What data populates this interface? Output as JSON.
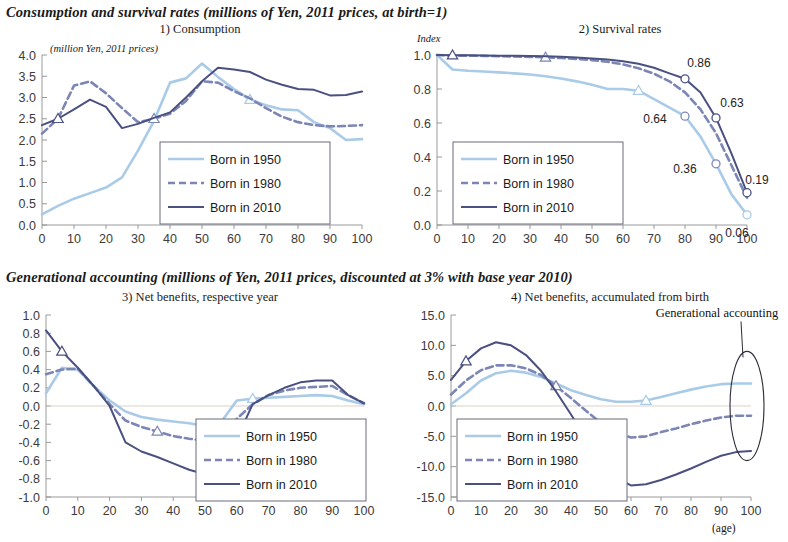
{
  "headings": {
    "section1": "Consumption and survival rates (millions of Yen, 2011 prices, at birth=1)",
    "section2": "Generational accounting (millions of Yen, 2011 prices, discounted at 3% with base year 2010)"
  },
  "axis_note_age": "(age)",
  "colors": {
    "born1950": "#a9cbe8",
    "born1980": "#7b86b5",
    "born2010": "#4a5080",
    "axis": "#8f8f8f",
    "gridline": "#cfcfcf",
    "text": "#1a1a1a"
  },
  "legend_labels": {
    "born1950": "Born in 1950",
    "born1980": "Born in 1980",
    "born2010": "Born in 2010"
  },
  "chart_data": [
    {
      "id": "consumption",
      "type": "line",
      "title": "1) Consumption",
      "unit_note": "(million Yen, 2011 prices)",
      "xlabel": "",
      "ylabel": "",
      "xlim": [
        0,
        100
      ],
      "ylim": [
        0,
        4.0
      ],
      "xticks": [
        0,
        10,
        20,
        30,
        40,
        50,
        60,
        70,
        80,
        90,
        100
      ],
      "yticks": [
        "0.0",
        "0.5",
        "1.0",
        "1.5",
        "2.0",
        "2.5",
        "3.0",
        "3.5",
        "4.0"
      ],
      "grid": false,
      "legend_position": "center-lower",
      "x": [
        0,
        5,
        10,
        15,
        20,
        25,
        30,
        35,
        40,
        45,
        50,
        55,
        60,
        65,
        70,
        75,
        80,
        85,
        90,
        95,
        100
      ],
      "series": [
        {
          "name": "Born in 1950",
          "color": "#a9cbe8",
          "style": "solid-light",
          "values": [
            0.25,
            0.45,
            0.62,
            0.75,
            0.88,
            1.12,
            1.75,
            2.45,
            3.35,
            3.45,
            3.8,
            3.48,
            3.2,
            2.95,
            2.82,
            2.72,
            2.7,
            2.42,
            2.28,
            2.0,
            2.02
          ],
          "marker": {
            "shape": "triangle",
            "x": 65
          }
        },
        {
          "name": "Born in 1980",
          "color": "#7b86b5",
          "style": "dashed",
          "values": [
            2.15,
            2.5,
            3.28,
            3.38,
            3.1,
            2.75,
            2.42,
            2.5,
            2.62,
            2.92,
            3.38,
            3.35,
            3.15,
            2.98,
            2.75,
            2.55,
            2.42,
            2.35,
            2.32,
            2.33,
            2.35
          ],
          "marker": {
            "shape": "triangle",
            "x": 35
          }
        },
        {
          "name": "Born in 2010",
          "color": "#4a5080",
          "style": "solid-dark",
          "values": [
            2.35,
            2.5,
            2.72,
            2.95,
            2.78,
            2.28,
            2.38,
            2.52,
            2.65,
            3.0,
            3.38,
            3.7,
            3.66,
            3.6,
            3.42,
            3.3,
            3.2,
            3.18,
            3.05,
            3.06,
            3.14
          ],
          "marker": {
            "shape": "triangle",
            "x": 5
          }
        }
      ]
    },
    {
      "id": "survival",
      "type": "line",
      "title": "2) Survival rates",
      "unit_note": "Index",
      "xlim": [
        0,
        100
      ],
      "ylim": [
        0,
        1.0
      ],
      "xticks": [
        0,
        10,
        20,
        30,
        40,
        50,
        60,
        70,
        80,
        90,
        100
      ],
      "yticks": [
        "0.0",
        "0.2",
        "0.4",
        "0.6",
        "0.8",
        "1.0"
      ],
      "grid": false,
      "legend_position": "center-left-lower",
      "x": [
        0,
        5,
        10,
        15,
        20,
        25,
        30,
        35,
        40,
        45,
        50,
        55,
        60,
        65,
        70,
        75,
        80,
        85,
        90,
        95,
        100
      ],
      "series": [
        {
          "name": "Born in 1950",
          "color": "#a9cbe8",
          "style": "solid-light",
          "values": [
            1.0,
            0.915,
            0.907,
            0.903,
            0.898,
            0.892,
            0.885,
            0.875,
            0.862,
            0.845,
            0.825,
            0.8,
            0.8,
            0.79,
            0.74,
            0.69,
            0.64,
            0.52,
            0.36,
            0.18,
            0.06
          ],
          "marker": {
            "shape": "triangle",
            "x": 65
          }
        },
        {
          "name": "Born in 1980",
          "color": "#7b86b5",
          "style": "dashed",
          "values": [
            1.0,
            0.997,
            0.996,
            0.995,
            0.993,
            0.991,
            0.989,
            0.986,
            0.982,
            0.977,
            0.97,
            0.96,
            0.945,
            0.922,
            0.89,
            0.845,
            0.78,
            0.68,
            0.54,
            0.35,
            0.16
          ],
          "marker": {
            "shape": "triangle",
            "x": 35
          }
        },
        {
          "name": "Born in 2010",
          "color": "#4a5080",
          "style": "solid-dark",
          "values": [
            1.0,
            0.999,
            0.998,
            0.997,
            0.996,
            0.995,
            0.994,
            0.992,
            0.989,
            0.985,
            0.98,
            0.973,
            0.963,
            0.948,
            0.925,
            0.892,
            0.86,
            0.78,
            0.63,
            0.42,
            0.19
          ],
          "marker": {
            "shape": "triangle",
            "x": 5
          }
        }
      ],
      "annotations": [
        {
          "label": "0.86",
          "x": 80,
          "y": 0.86,
          "series": "Born in 2010",
          "dot": true,
          "tx": 14,
          "ty": -12
        },
        {
          "label": "0.63",
          "x": 90,
          "y": 0.63,
          "series": "Born in 2010",
          "dot": true,
          "tx": 16,
          "ty": -11
        },
        {
          "label": "0.19",
          "x": 100,
          "y": 0.19,
          "series": "Born in 2010",
          "dot": true,
          "tx": 10,
          "ty": -9
        },
        {
          "label": "0.64",
          "x": 80,
          "y": 0.64,
          "series": "Born in 1980",
          "dot": true,
          "tx": -30,
          "ty": 7
        },
        {
          "label": "0.36",
          "x": 90,
          "y": 0.36,
          "series": "Born in 1980",
          "dot": true,
          "tx": -31,
          "ty": 9
        },
        {
          "label": "0.06",
          "x": 100,
          "y": 0.06,
          "series": "Born in 1950",
          "dot": true,
          "tx": -10,
          "ty": 22
        }
      ]
    },
    {
      "id": "net-benefits-year",
      "type": "line",
      "title": "3) Net benefits, respective year",
      "unit_note": "",
      "xlim": [
        0,
        100
      ],
      "ylim": [
        -1.0,
        1.0
      ],
      "xticks": [
        0,
        10,
        20,
        30,
        40,
        50,
        60,
        70,
        80,
        90,
        100
      ],
      "yticks": [
        "-1.0",
        "-0.8",
        "-0.6",
        "-0.4",
        "-0.2",
        "0.0",
        "0.2",
        "0.4",
        "0.6",
        "0.8",
        "1.0"
      ],
      "grid": false,
      "legend_position": "right-lower",
      "x": [
        0,
        5,
        10,
        15,
        20,
        25,
        30,
        35,
        40,
        45,
        50,
        55,
        60,
        65,
        70,
        75,
        80,
        85,
        90,
        95,
        100
      ],
      "series": [
        {
          "name": "Born in 1950",
          "color": "#a9cbe8",
          "style": "solid-light",
          "values": [
            0.14,
            0.42,
            0.4,
            0.22,
            0.06,
            -0.06,
            -0.12,
            -0.15,
            -0.17,
            -0.19,
            -0.22,
            -0.18,
            0.06,
            0.08,
            0.09,
            0.1,
            0.11,
            0.12,
            0.11,
            0.06,
            0.02
          ],
          "marker": {
            "shape": "triangle",
            "x": 65
          }
        },
        {
          "name": "Born in 1980",
          "color": "#7b86b5",
          "style": "dashed",
          "values": [
            0.35,
            0.4,
            0.41,
            0.22,
            0.02,
            -0.16,
            -0.23,
            -0.28,
            -0.33,
            -0.36,
            -0.38,
            -0.36,
            -0.14,
            0.02,
            0.12,
            0.17,
            0.2,
            0.21,
            0.22,
            0.12,
            0.03
          ],
          "marker": {
            "shape": "triangle",
            "x": 35
          }
        },
        {
          "name": "Born in 2010",
          "color": "#4a5080",
          "style": "solid-dark",
          "values": [
            0.83,
            0.6,
            0.42,
            0.22,
            0.0,
            -0.4,
            -0.5,
            -0.56,
            -0.63,
            -0.7,
            -0.75,
            -0.71,
            -0.36,
            0.02,
            0.12,
            0.2,
            0.26,
            0.28,
            0.28,
            0.12,
            0.03
          ],
          "marker": {
            "shape": "triangle",
            "x": 5
          }
        }
      ]
    },
    {
      "id": "net-benefits-accum",
      "type": "line",
      "title": "4) Net benefits, accumulated from birth",
      "unit_note": "",
      "xlim": [
        0,
        100
      ],
      "ylim": [
        -15.0,
        15.0
      ],
      "xticks": [
        0,
        10,
        20,
        30,
        40,
        50,
        60,
        70,
        80,
        90,
        100
      ],
      "yticks": [
        "-15.0",
        "-10.0",
        "-5.0",
        "0.0",
        "5.0",
        "10.0",
        "15.0"
      ],
      "grid": false,
      "legend_position": "left-lower",
      "x": [
        0,
        5,
        10,
        15,
        20,
        25,
        30,
        35,
        40,
        45,
        50,
        55,
        60,
        65,
        70,
        75,
        80,
        85,
        90,
        95,
        100
      ],
      "series": [
        {
          "name": "Born in 1950",
          "color": "#a9cbe8",
          "style": "solid-light",
          "values": [
            0.3,
            2.1,
            4.2,
            5.4,
            5.8,
            5.5,
            4.8,
            3.7,
            2.6,
            1.8,
            1.1,
            0.7,
            0.7,
            0.9,
            1.5,
            2.1,
            2.7,
            3.2,
            3.6,
            3.7,
            3.7
          ],
          "marker": {
            "shape": "triangle",
            "x": 65
          }
        },
        {
          "name": "Born in 1980",
          "color": "#7b86b5",
          "style": "dashed",
          "values": [
            1.9,
            4.2,
            5.9,
            6.7,
            6.7,
            6.2,
            5.1,
            3.3,
            1.3,
            -0.8,
            -2.8,
            -4.3,
            -5.2,
            -5.0,
            -4.3,
            -3.7,
            -3.0,
            -2.4,
            -1.9,
            -1.6,
            -1.6
          ],
          "marker": {
            "shape": "triangle",
            "x": 35
          }
        },
        {
          "name": "Born in 2010",
          "color": "#4a5080",
          "style": "solid-dark",
          "values": [
            4.3,
            7.4,
            9.5,
            10.5,
            10.0,
            8.4,
            5.8,
            2.4,
            -1.4,
            -5.4,
            -9.2,
            -11.9,
            -13.1,
            -12.9,
            -12.2,
            -11.3,
            -10.3,
            -9.2,
            -8.2,
            -7.6,
            -7.4
          ],
          "marker": {
            "shape": "triangle",
            "x": 5
          }
        }
      ],
      "callout": {
        "label": "Generational accounting",
        "ellipse": {
          "cx": 100,
          "cy_lo": -9.0,
          "cy_hi": 9.0
        }
      }
    }
  ]
}
